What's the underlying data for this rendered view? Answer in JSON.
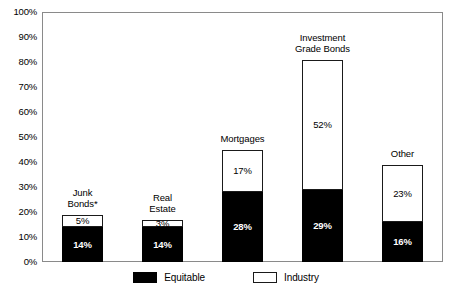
{
  "chart_data": {
    "type": "bar",
    "subtype": "stacked-bar",
    "title": "",
    "xlabel": "",
    "ylabel": "",
    "ylim": [
      0,
      100
    ],
    "grid": false,
    "legend_position": "bottom",
    "y_ticks": [
      "0%",
      "10%",
      "20%",
      "30%",
      "40%",
      "50%",
      "60%",
      "70%",
      "80%",
      "90%",
      "100%"
    ],
    "y_tick_values": [
      0,
      10,
      20,
      30,
      40,
      50,
      60,
      70,
      80,
      90,
      100
    ],
    "categories": [
      "Junk\nBonds*",
      "Real\nEstate",
      "Mortgages",
      "Investment\nGrade Bonds",
      "Other"
    ],
    "series": [
      {
        "name": "Equitable",
        "color": "#000000",
        "values": [
          14,
          14,
          28,
          29,
          16
        ],
        "labels": [
          "14%",
          "14%",
          "28%",
          "29%",
          "16%"
        ]
      },
      {
        "name": "Industry",
        "color": "#ffffff",
        "values": [
          5,
          3,
          17,
          52,
          23
        ],
        "labels": [
          "5%",
          "3%",
          "17%",
          "52%",
          "23%"
        ]
      }
    ],
    "totals": [
      19,
      17,
      45,
      81,
      39
    ]
  },
  "legend": {
    "items": [
      {
        "label": "Equitable",
        "swatch": "black-swatch-icon"
      },
      {
        "label": "Industry",
        "swatch": "white-swatch-icon"
      }
    ]
  }
}
